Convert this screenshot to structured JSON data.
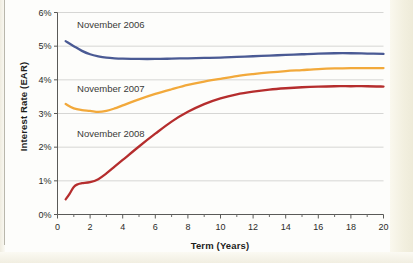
{
  "figure": {
    "background_color": "#fdfdfb",
    "page_margin_color": "#f2efdf"
  },
  "chart_data": {
    "type": "line",
    "title": "",
    "xlabel": "Term (Years)",
    "ylabel": "Interest Rate (EAR)",
    "xlim": [
      0,
      20
    ],
    "ylim": [
      0,
      6
    ],
    "grid": true,
    "legend_position": "inline-annotations",
    "x_ticks": [
      0,
      2,
      4,
      6,
      8,
      10,
      12,
      14,
      16,
      18,
      20
    ],
    "x_tick_labels": [
      "0",
      "2",
      "4",
      "6",
      "8",
      "10",
      "12",
      "14",
      "16",
      "18",
      "20"
    ],
    "x_minor_ticks": [
      1,
      3,
      5,
      7,
      9,
      11,
      13,
      15,
      17,
      19
    ],
    "y_ticks": [
      0,
      1,
      2,
      3,
      4,
      5,
      6
    ],
    "y_tick_labels": [
      "0%",
      "1%",
      "2%",
      "3%",
      "4%",
      "5%",
      "6%"
    ],
    "series": [
      {
        "name": "November 2006",
        "color": "#4a5a94",
        "label_x": 1.2,
        "label_y": 5.62,
        "x": [
          0.5,
          1,
          1.5,
          2,
          2.5,
          3,
          3.5,
          4,
          5,
          6,
          7,
          8,
          9,
          10,
          11,
          12,
          13,
          14,
          15,
          16,
          17,
          18,
          19,
          20
        ],
        "values": [
          5.15,
          5.0,
          4.86,
          4.76,
          4.7,
          4.66,
          4.64,
          4.63,
          4.62,
          4.62,
          4.63,
          4.64,
          4.65,
          4.66,
          4.68,
          4.7,
          4.72,
          4.74,
          4.76,
          4.78,
          4.79,
          4.79,
          4.78,
          4.77
        ]
      },
      {
        "name": "November 2007",
        "color": "#f2a93b",
        "label_x": 1.2,
        "label_y": 3.72,
        "x": [
          0.5,
          1,
          1.5,
          2,
          2.5,
          3,
          3.5,
          4,
          5,
          6,
          7,
          8,
          9,
          10,
          11,
          12,
          13,
          14,
          15,
          16,
          17,
          18,
          19,
          20
        ],
        "values": [
          3.28,
          3.15,
          3.1,
          3.08,
          3.05,
          3.08,
          3.15,
          3.24,
          3.42,
          3.58,
          3.72,
          3.85,
          3.95,
          4.03,
          4.11,
          4.17,
          4.22,
          4.26,
          4.29,
          4.32,
          4.34,
          4.35,
          4.35,
          4.35
        ]
      },
      {
        "name": "November 2008",
        "color": "#b52d2d",
        "label_x": 1.2,
        "label_y": 2.38,
        "x": [
          0.5,
          0.75,
          1,
          1.25,
          1.5,
          2,
          2.5,
          3,
          3.5,
          4,
          5,
          6,
          7,
          8,
          9,
          10,
          11,
          12,
          13,
          14,
          15,
          16,
          17,
          18,
          19,
          20
        ],
        "values": [
          0.45,
          0.62,
          0.82,
          0.9,
          0.93,
          0.96,
          1.05,
          1.22,
          1.42,
          1.62,
          2.02,
          2.4,
          2.76,
          3.05,
          3.28,
          3.45,
          3.57,
          3.65,
          3.71,
          3.75,
          3.78,
          3.8,
          3.81,
          3.81,
          3.81,
          3.8
        ]
      }
    ]
  }
}
